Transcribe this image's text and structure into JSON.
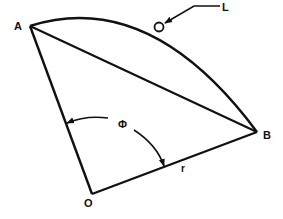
{
  "diagram": {
    "points": {
      "A": {
        "label": "A"
      },
      "B": {
        "label": "B"
      },
      "O": {
        "label": "O"
      }
    },
    "annotations": {
      "L": {
        "label": "L"
      },
      "phi": {
        "label": "Φ"
      },
      "r": {
        "label": "r"
      }
    },
    "colors": {
      "stroke": "#111111",
      "background": "#ffffff"
    }
  }
}
